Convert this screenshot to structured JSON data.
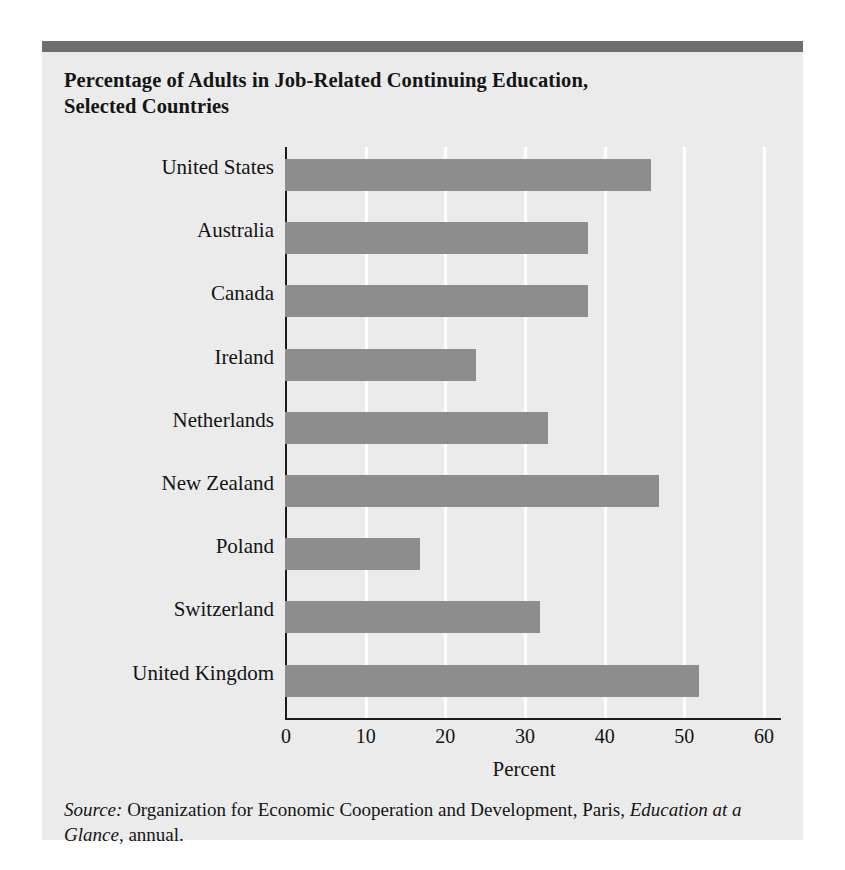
{
  "figure": {
    "title": "Percentage of Adults in Job-Related Continuing Education, Selected Countries",
    "title_line_1": "Percentage of Adults in Job-Related Continuing Education,",
    "title_line_2": "Selected Countries",
    "source_label": "Source:",
    "source_text_1": " Organization for Economic Cooperation and Development, Paris, ",
    "source_italic_title": "Education at a Glance",
    "source_text_2": ", annual.",
    "colors": {
      "panel_background": "#ebebeb",
      "header_rule": "#6e6e6e",
      "bar_fill": "#8d8d8d",
      "axis_line": "#1c1c1c",
      "gridline": "#ffffff",
      "text": "#141414"
    }
  },
  "chart_data": {
    "type": "bar",
    "orientation": "horizontal",
    "title": "Percentage of Adults in Job-Related Continuing Education, Selected Countries",
    "xlabel": "Percent",
    "ylabel": "",
    "xlim": [
      0,
      60
    ],
    "xticks": [
      0,
      10,
      20,
      30,
      40,
      50,
      60
    ],
    "xtick_labels": [
      "0",
      "10",
      "20",
      "30",
      "40",
      "50",
      "60"
    ],
    "grid": "vertical-white-gridlines",
    "legend": "none",
    "categories": [
      "United States",
      "Australia",
      "Canada",
      "Ireland",
      "Netherlands",
      "New Zealand",
      "Poland",
      "Switzerland",
      "United Kingdom"
    ],
    "values": [
      46,
      38,
      38,
      24,
      33,
      47,
      17,
      32,
      52
    ],
    "series": [
      {
        "name": "Percentage of adults in job-related continuing education",
        "values": [
          46,
          38,
          38,
          24,
          33,
          47,
          17,
          32,
          52
        ]
      }
    ],
    "source": "Organization for Economic Cooperation and Development, Paris, Education at a Glance, annual."
  }
}
